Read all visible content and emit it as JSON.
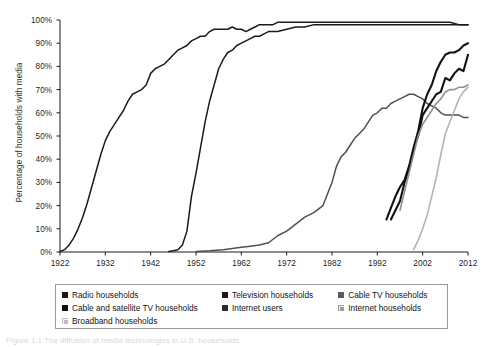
{
  "chart_data": {
    "type": "line",
    "title": "",
    "xlabel": "",
    "ylabel": "Percentage of households with media",
    "xlim": [
      1922,
      2012
    ],
    "ylim": [
      0,
      100
    ],
    "grid": false,
    "legend_position": "bottom",
    "xticks": [
      "1922",
      "1932",
      "1942",
      "1952",
      "1962",
      "1972",
      "1982",
      "1992",
      "2002",
      "2012"
    ],
    "yticks": [
      "0%",
      "10%",
      "20%",
      "30%",
      "40%",
      "50%",
      "60%",
      "70%",
      "80%",
      "90%",
      "100%"
    ],
    "series": [
      {
        "name": "Radio households",
        "color": "#1a1a1a",
        "width": 1.5,
        "points": [
          [
            1922,
            0.2
          ],
          [
            1923,
            1
          ],
          [
            1924,
            3
          ],
          [
            1925,
            6
          ],
          [
            1926,
            10
          ],
          [
            1927,
            15
          ],
          [
            1928,
            21
          ],
          [
            1929,
            28
          ],
          [
            1930,
            35
          ],
          [
            1931,
            42
          ],
          [
            1932,
            48
          ],
          [
            1933,
            52
          ],
          [
            1934,
            55
          ],
          [
            1935,
            58
          ],
          [
            1936,
            61
          ],
          [
            1937,
            65
          ],
          [
            1938,
            68
          ],
          [
            1939,
            69
          ],
          [
            1940,
            70
          ],
          [
            1941,
            72
          ],
          [
            1942,
            77
          ],
          [
            1943,
            79
          ],
          [
            1944,
            80
          ],
          [
            1945,
            81
          ],
          [
            1946,
            83
          ],
          [
            1947,
            85
          ],
          [
            1948,
            87
          ],
          [
            1949,
            88
          ],
          [
            1950,
            89
          ],
          [
            1951,
            91
          ],
          [
            1952,
            92
          ],
          [
            1953,
            93
          ],
          [
            1954,
            93
          ],
          [
            1955,
            95
          ],
          [
            1956,
            96
          ],
          [
            1957,
            96
          ],
          [
            1958,
            96
          ],
          [
            1959,
            96
          ],
          [
            1960,
            97
          ],
          [
            1961,
            96
          ],
          [
            1962,
            96
          ],
          [
            1963,
            95
          ],
          [
            1964,
            96
          ],
          [
            1965,
            97
          ],
          [
            1966,
            98
          ],
          [
            1967,
            98
          ],
          [
            1968,
            98
          ],
          [
            1969,
            98
          ],
          [
            1970,
            99
          ],
          [
            1975,
            99
          ],
          [
            1980,
            99
          ],
          [
            1985,
            99
          ],
          [
            1990,
            99
          ],
          [
            1995,
            99
          ],
          [
            2000,
            99
          ],
          [
            2005,
            99
          ],
          [
            2008,
            99
          ],
          [
            2010,
            98
          ],
          [
            2012,
            98
          ]
        ]
      },
      {
        "name": "Television households",
        "color": "#1a1a1a",
        "width": 1.5,
        "points": [
          [
            1946,
            0.2
          ],
          [
            1947,
            0.5
          ],
          [
            1948,
            1
          ],
          [
            1949,
            3
          ],
          [
            1950,
            9
          ],
          [
            1951,
            24
          ],
          [
            1952,
            34
          ],
          [
            1953,
            45
          ],
          [
            1954,
            56
          ],
          [
            1955,
            65
          ],
          [
            1956,
            72
          ],
          [
            1957,
            79
          ],
          [
            1958,
            83
          ],
          [
            1959,
            86
          ],
          [
            1960,
            87
          ],
          [
            1961,
            89
          ],
          [
            1962,
            90
          ],
          [
            1963,
            91
          ],
          [
            1964,
            92
          ],
          [
            1965,
            93
          ],
          [
            1966,
            93
          ],
          [
            1967,
            94
          ],
          [
            1968,
            95
          ],
          [
            1969,
            95
          ],
          [
            1970,
            95
          ],
          [
            1972,
            96
          ],
          [
            1974,
            97
          ],
          [
            1976,
            97
          ],
          [
            1978,
            98
          ],
          [
            1980,
            98
          ],
          [
            1982,
            98
          ],
          [
            1985,
            98
          ],
          [
            1990,
            98
          ],
          [
            1995,
            98
          ],
          [
            2000,
            98
          ],
          [
            2005,
            98
          ],
          [
            2010,
            98
          ],
          [
            2012,
            98
          ]
        ]
      },
      {
        "name": "Cable TV households",
        "color": "#4f4f4f",
        "width": 1.5,
        "points": [
          [
            1952,
            0.2
          ],
          [
            1955,
            0.5
          ],
          [
            1958,
            1
          ],
          [
            1960,
            1.5
          ],
          [
            1962,
            2
          ],
          [
            1964,
            2.5
          ],
          [
            1966,
            3
          ],
          [
            1968,
            4
          ],
          [
            1970,
            7
          ],
          [
            1972,
            9
          ],
          [
            1974,
            12
          ],
          [
            1976,
            15
          ],
          [
            1978,
            17
          ],
          [
            1980,
            20
          ],
          [
            1981,
            25
          ],
          [
            1982,
            30
          ],
          [
            1983,
            37
          ],
          [
            1984,
            41
          ],
          [
            1985,
            43
          ],
          [
            1986,
            46
          ],
          [
            1987,
            49
          ],
          [
            1988,
            51
          ],
          [
            1989,
            53
          ],
          [
            1990,
            56
          ],
          [
            1991,
            59
          ],
          [
            1992,
            60
          ],
          [
            1993,
            62
          ],
          [
            1994,
            62
          ],
          [
            1995,
            64
          ],
          [
            1996,
            65
          ],
          [
            1997,
            66
          ],
          [
            1998,
            67
          ],
          [
            1999,
            68
          ],
          [
            2000,
            68
          ],
          [
            2001,
            67
          ],
          [
            2002,
            66
          ],
          [
            2003,
            64
          ],
          [
            2004,
            63
          ],
          [
            2005,
            62
          ],
          [
            2006,
            60
          ],
          [
            2007,
            59
          ],
          [
            2008,
            59
          ],
          [
            2009,
            59
          ],
          [
            2010,
            59
          ],
          [
            2011,
            58
          ],
          [
            2012,
            58
          ]
        ]
      },
      {
        "name": "Cable and satellite TV households",
        "color": "#111111",
        "width": 2.1,
        "points": [
          [
            1994,
            14
          ],
          [
            1995,
            19
          ],
          [
            1996,
            24
          ],
          [
            1997,
            28
          ],
          [
            1998,
            31
          ],
          [
            1999,
            37
          ],
          [
            2000,
            45
          ],
          [
            2001,
            52
          ],
          [
            2002,
            62
          ],
          [
            2003,
            68
          ],
          [
            2004,
            72
          ],
          [
            2005,
            78
          ],
          [
            2006,
            82
          ],
          [
            2007,
            85
          ],
          [
            2008,
            86
          ],
          [
            2009,
            86
          ],
          [
            2010,
            87
          ],
          [
            2011,
            89
          ],
          [
            2012,
            90
          ]
        ]
      },
      {
        "name": "Internet users",
        "color": "#111111",
        "width": 2.1,
        "points": [
          [
            1995,
            14
          ],
          [
            1996,
            18
          ],
          [
            1997,
            22
          ],
          [
            1998,
            30
          ],
          [
            1999,
            36
          ],
          [
            2000,
            44
          ],
          [
            2001,
            50
          ],
          [
            2002,
            59
          ],
          [
            2003,
            62
          ],
          [
            2004,
            65
          ],
          [
            2005,
            68
          ],
          [
            2006,
            69
          ],
          [
            2007,
            75
          ],
          [
            2008,
            74
          ],
          [
            2009,
            77
          ],
          [
            2010,
            79
          ],
          [
            2011,
            78
          ],
          [
            2012,
            85
          ]
        ]
      },
      {
        "name": "Internet households",
        "color": "#8f8f8f",
        "width": 1.6,
        "points": [
          [
            1997,
            18
          ],
          [
            1998,
            26
          ],
          [
            1999,
            34
          ],
          [
            2000,
            42
          ],
          [
            2001,
            50
          ],
          [
            2002,
            55
          ],
          [
            2003,
            58
          ],
          [
            2004,
            61
          ],
          [
            2005,
            64
          ],
          [
            2006,
            66
          ],
          [
            2007,
            69
          ],
          [
            2008,
            70
          ],
          [
            2009,
            70
          ],
          [
            2010,
            71
          ],
          [
            2011,
            71
          ],
          [
            2012,
            72
          ]
        ]
      },
      {
        "name": "Broadband households",
        "color": "#b3b3b3",
        "width": 1.6,
        "points": [
          [
            2000,
            1
          ],
          [
            2001,
            5
          ],
          [
            2002,
            10
          ],
          [
            2003,
            16
          ],
          [
            2004,
            24
          ],
          [
            2005,
            32
          ],
          [
            2006,
            42
          ],
          [
            2007,
            51
          ],
          [
            2008,
            56
          ],
          [
            2009,
            61
          ],
          [
            2010,
            66
          ],
          [
            2011,
            69
          ],
          [
            2012,
            71
          ]
        ]
      }
    ]
  },
  "legend": {
    "rows": [
      [
        {
          "label": "Radio households",
          "color": "#1a1a1a",
          "light": false,
          "w": 168
        },
        {
          "label": "Television households",
          "color": "#1a1a1a",
          "light": false,
          "w": 122
        },
        {
          "label": "Cable TV households",
          "color": "#5a5a5a",
          "light": false,
          "w": 110
        }
      ],
      [
        {
          "label": "Cable and satellite TV households",
          "color": "#111111",
          "light": false,
          "w": 168
        },
        {
          "label": "Internet users",
          "color": "#2b2b2b",
          "light": false,
          "w": 122
        },
        {
          "label": "Internet households",
          "color": "#9a9a9a",
          "light": true,
          "w": 110
        }
      ],
      [
        {
          "label": "Broadband households",
          "color": "#bdbdbd",
          "light": true,
          "w": 168
        }
      ]
    ]
  },
  "caption": {
    "text": "Figure 1.1  The diffusion of media technologies in U.S. households"
  }
}
